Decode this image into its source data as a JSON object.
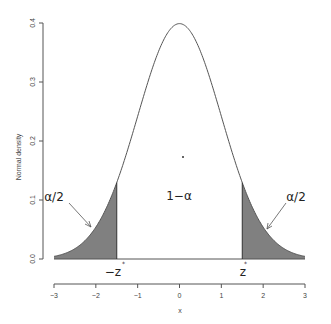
{
  "chart_data": {
    "type": "area",
    "title": "",
    "xlabel": "x",
    "ylabel": "Normal density",
    "xlim": [
      -3,
      3
    ],
    "ylim": [
      0,
      0.4
    ],
    "x_ticks": [
      "-3",
      "-2",
      "-1",
      "0",
      "1",
      "2",
      "3"
    ],
    "y_ticks": [
      "0.0",
      "0.1",
      "0.2",
      "0.3",
      "0.4"
    ],
    "grid": false,
    "series": [
      {
        "name": "standard normal density",
        "function": "dnorm(x)",
        "mean": 0,
        "sd": 1
      }
    ],
    "critical_value": 1.5,
    "shaded_regions": [
      {
        "from": -3,
        "to": -1.5,
        "label": "α/2",
        "color": "#808080"
      },
      {
        "from": 1.5,
        "to": 3,
        "label": "α/2",
        "color": "#808080"
      }
    ],
    "annotations": {
      "left_tail": "α/2",
      "right_tail": "α/2",
      "center": "1−α",
      "left_critical": "−z",
      "right_critical": "z",
      "critical_superscript": "*"
    }
  },
  "colors": {
    "curve": "#555555",
    "shade": "#808080",
    "axis": "#555555"
  }
}
